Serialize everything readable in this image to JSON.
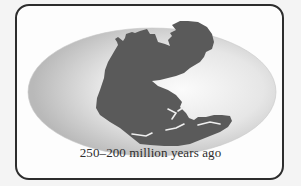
{
  "figure": {
    "caption": "250–200 million years ago",
    "colors": {
      "frame_border": "#2d2d2d",
      "ocean_light": "#f7f7f7",
      "ocean_dark": "#bdbdbd",
      "land": "#5a5a5a",
      "background": "#f4f4f4"
    }
  }
}
